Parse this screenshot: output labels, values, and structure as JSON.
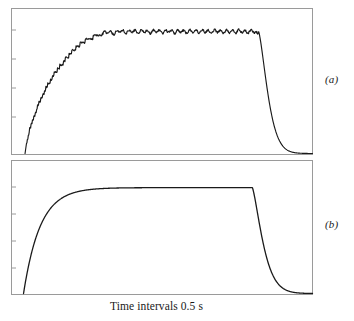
{
  "figure": {
    "title": "",
    "xaxis_caption": "Time intervals 0.5 s",
    "panel_a_label": "(a)",
    "panel_b_label": "(b)",
    "frame_color": "#9a9a9a",
    "curve_color": "#1a1a1a",
    "background": "#ffffff"
  },
  "chart_data": {
    "type": "line",
    "title": "",
    "xlabel": "Time intervals 0.5 s",
    "ylabel": "",
    "grid": false,
    "legend": null,
    "panels": [
      {
        "id": "a",
        "label": "(a)",
        "description": "Noisy stepped exponential rise to a rippled plateau, then exponential decay to baseline",
        "xlim": [
          0,
          100
        ],
        "ylim": [
          0,
          1.05
        ],
        "axis_ticks_left": 5,
        "noise": true,
        "segments": {
          "rise_start_x": 5,
          "rise_end_x": 30,
          "plateau_start_x": 30,
          "plateau_level": 0.93,
          "decay_start_x": 82,
          "decay_end_x": 100,
          "decay_tau": 4.0
        },
        "x": [
          4.5,
          5,
          6,
          7,
          8,
          9,
          10,
          11,
          12,
          13,
          14,
          15,
          16,
          17,
          18,
          19,
          20,
          21,
          22,
          23,
          24,
          25,
          26,
          27,
          28,
          29,
          30,
          32,
          34,
          36,
          38,
          40,
          42,
          44,
          46,
          48,
          50,
          52,
          54,
          56,
          58,
          60,
          62,
          64,
          66,
          68,
          70,
          72,
          74,
          76,
          78,
          80,
          81,
          82,
          83,
          84,
          85,
          86,
          87,
          88,
          89,
          90,
          92,
          94,
          96,
          98,
          100
        ],
        "y": [
          0.0,
          0.08,
          0.18,
          0.25,
          0.3,
          0.38,
          0.42,
          0.47,
          0.52,
          0.55,
          0.6,
          0.62,
          0.66,
          0.68,
          0.72,
          0.74,
          0.77,
          0.79,
          0.81,
          0.83,
          0.85,
          0.86,
          0.88,
          0.88,
          0.9,
          0.9,
          0.91,
          0.92,
          0.91,
          0.93,
          0.92,
          0.93,
          0.92,
          0.93,
          0.92,
          0.93,
          0.92,
          0.93,
          0.92,
          0.93,
          0.92,
          0.93,
          0.92,
          0.93,
          0.92,
          0.93,
          0.92,
          0.93,
          0.92,
          0.93,
          0.92,
          0.93,
          0.92,
          0.9,
          0.82,
          0.68,
          0.54,
          0.42,
          0.32,
          0.24,
          0.18,
          0.13,
          0.07,
          0.04,
          0.02,
          0.01,
          0.0
        ]
      },
      {
        "id": "b",
        "label": "(b)",
        "description": "Smooth exponential rise to a flat plateau, then exponential decay to baseline",
        "xlim": [
          0,
          100
        ],
        "ylim": [
          0,
          1.05
        ],
        "axis_ticks_left": 4,
        "noise": false,
        "segments": {
          "rise_start_x": 4,
          "rise_tau": 5.5,
          "plateau_level": 0.9,
          "decay_start_x": 80,
          "decay_end_x": 100,
          "decay_tau": 4.5
        },
        "x": [
          4,
          5,
          6,
          7,
          8,
          9,
          10,
          12,
          14,
          16,
          18,
          20,
          24,
          28,
          32,
          36,
          40,
          50,
          60,
          70,
          78,
          80,
          81,
          82,
          83,
          84,
          85,
          86,
          88,
          90,
          92,
          94,
          96,
          98,
          100
        ],
        "y": [
          0.0,
          0.2,
          0.36,
          0.48,
          0.57,
          0.64,
          0.7,
          0.78,
          0.83,
          0.86,
          0.875,
          0.885,
          0.895,
          0.898,
          0.9,
          0.9,
          0.9,
          0.9,
          0.9,
          0.9,
          0.9,
          0.9,
          0.88,
          0.8,
          0.66,
          0.52,
          0.4,
          0.31,
          0.19,
          0.12,
          0.07,
          0.04,
          0.02,
          0.01,
          0.0
        ]
      }
    ]
  }
}
